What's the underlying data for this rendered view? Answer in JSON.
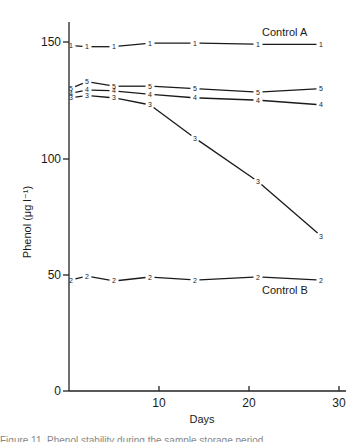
{
  "chart_data": {
    "type": "line",
    "title": "",
    "xlabel": "Days",
    "ylabel": "Phenol (μg l⁻¹)",
    "xlim": [
      0,
      30
    ],
    "ylim": [
      0,
      160
    ],
    "x_ticks": [
      10,
      20,
      30
    ],
    "y_ticks": [
      0,
      50,
      100,
      150
    ],
    "grid": false,
    "legend": "none (series labelled by numeric markers 1–5 on points)",
    "x": [
      0,
      2,
      5,
      9,
      14,
      21,
      28
    ],
    "series": [
      {
        "name": "1",
        "marker": "1",
        "values": [
          148.5,
          148,
          148,
          149.5,
          149.5,
          149,
          149
        ]
      },
      {
        "name": "2",
        "marker": "2",
        "values": [
          47.7,
          49.4,
          47.3,
          49,
          47.7,
          49,
          47.7
        ]
      },
      {
        "name": "3",
        "marker": "3",
        "values": [
          126,
          127,
          126,
          123,
          108.7,
          90,
          66.6
        ]
      },
      {
        "name": "4",
        "marker": "4",
        "values": [
          128,
          129.4,
          129,
          127.5,
          126,
          125,
          123
        ]
      },
      {
        "name": "5",
        "marker": "5",
        "values": [
          130,
          133,
          131,
          131,
          130,
          128.5,
          130
        ]
      }
    ],
    "annotations": [
      {
        "text": "Control A",
        "series": "1"
      },
      {
        "text": "Control B",
        "series": "2"
      }
    ]
  },
  "labels": {
    "xlabel": "Days",
    "ylabel": "Phenol (μg l⁻¹)",
    "control_a": "Control A",
    "control_b": "Control B",
    "tick_y_0": "0",
    "tick_y_50": "50",
    "tick_y_100": "100",
    "tick_y_150": "150",
    "tick_x_10": "10",
    "tick_x_20": "20",
    "tick_x_30": "30"
  },
  "caption": "Figure 11. Phenol stability during the sample storage period"
}
